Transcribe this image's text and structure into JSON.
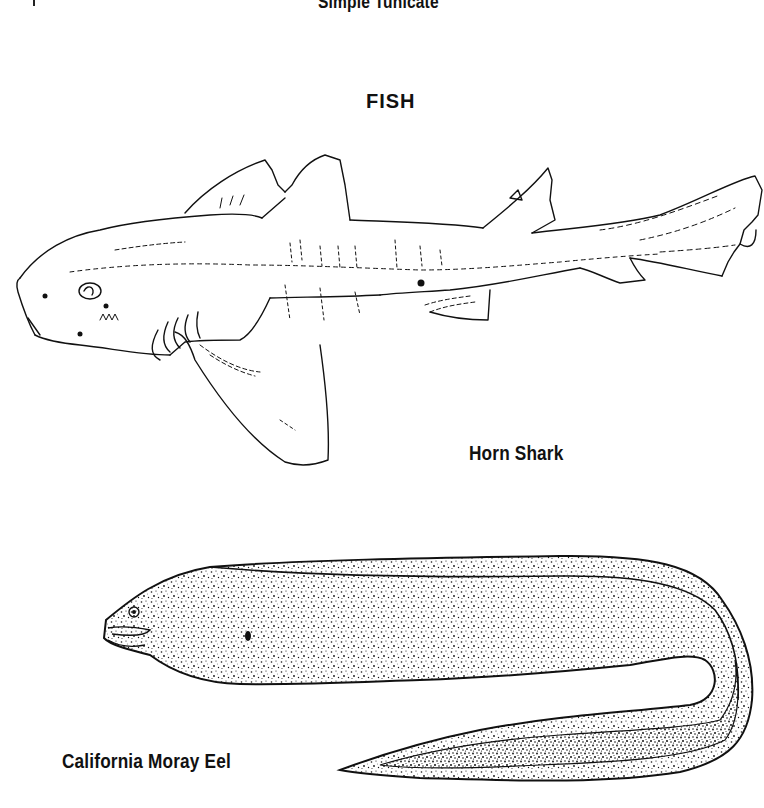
{
  "page": {
    "top_caption": "Simple Tunicate",
    "section_heading": "FISH",
    "figures": [
      {
        "id": "horn-shark",
        "caption": "Horn Shark",
        "style": "line drawing"
      },
      {
        "id": "california-moray-eel",
        "caption": "California Moray Eel",
        "style": "stippled drawing"
      }
    ]
  },
  "colors": {
    "background": "#ffffff",
    "ink": "#111111"
  }
}
